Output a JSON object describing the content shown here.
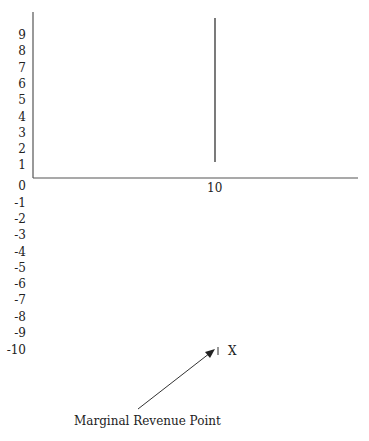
{
  "chart_data": {
    "type": "line",
    "title": "",
    "xlabel": "",
    "ylabel": "",
    "y_ticks": [
      "9",
      "8",
      "7",
      "6",
      "5",
      "4",
      "3",
      "2",
      "1",
      "0",
      "-1",
      "-2",
      "-3",
      "-4",
      "-5",
      "-6",
      "-7",
      "-8",
      "-9",
      "-10"
    ],
    "x_ticks": [
      "10"
    ],
    "ylim": [
      -10,
      10
    ],
    "series": [
      {
        "name": "vertical line at x=10",
        "x": [
          10,
          10
        ],
        "y": [
          1,
          10
        ]
      }
    ],
    "annotations": [
      {
        "text": "X",
        "point": [
          10,
          -10
        ]
      },
      {
        "text": "Marginal Revenue Point",
        "arrow_to": [
          10,
          -10
        ]
      }
    ]
  },
  "labels": {
    "y_ticks": [
      "9",
      "8",
      "7",
      "6",
      "5",
      "4",
      "3",
      "2",
      "1",
      "0",
      "-1",
      "-2",
      "-3",
      "-4",
      "-5",
      "-6",
      "-7",
      "-8",
      "-9",
      "-10"
    ],
    "x_tick": "10",
    "point_marker": "X",
    "annotation": "Marginal Revenue Point"
  }
}
